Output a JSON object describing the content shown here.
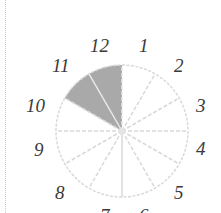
{
  "figure": {
    "hour_labels": [
      "12",
      "1",
      "2",
      "3",
      "4",
      "5",
      "6",
      "7",
      "8",
      "9",
      "10",
      "11"
    ],
    "shaded_sectors": [
      {
        "from_hour": "10",
        "to_hour": "11"
      },
      {
        "from_hour": "11",
        "to_hour": "12"
      }
    ],
    "colors": {
      "shaded": "#a9a9a9",
      "divider": "#d9d9d9",
      "outline": "#d9d9d9",
      "labels": "#3a3a3a",
      "page_edge": "#c8c8c8"
    }
  }
}
